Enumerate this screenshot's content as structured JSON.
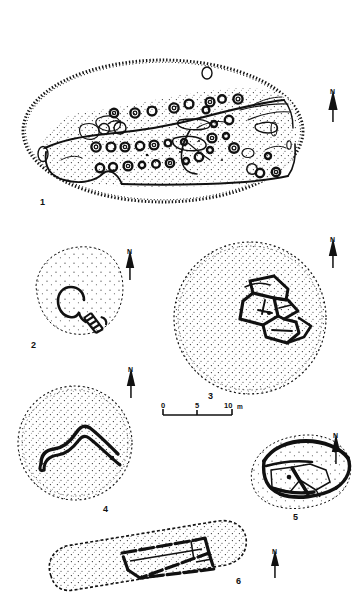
{
  "figure": {
    "kind": "archaeological-site-plans",
    "background_color": "#ffffff",
    "ink_color": "#111111",
    "width": 356,
    "height": 608
  },
  "panels": [
    {
      "id": "panel-1",
      "label": "1",
      "label_x": 40,
      "label_y": 198,
      "description": "Large oval enclosure with hachured outer bank, stippled interior and many small ring features",
      "north": {
        "label": "N",
        "x": 330,
        "y": 88
      }
    },
    {
      "id": "panel-2",
      "label": "2",
      "label_x": 31,
      "label_y": 341,
      "description": "Small circular stippled mound with keyhole-shaped structure and walled passage",
      "north": {
        "label": "N",
        "x": 127,
        "y": 248
      }
    },
    {
      "id": "panel-3",
      "label": "3",
      "label_x": 208,
      "label_y": 392,
      "description": "Large circular stippled mound with central rectilinear building complex",
      "north": {
        "label": "N",
        "x": 330,
        "y": 236
      }
    },
    {
      "id": "panel-4",
      "label": "4",
      "label_x": 103,
      "label_y": 505,
      "description": "Circular stippled mound with V-shaped (chevron) double wall",
      "north": {
        "label": "N",
        "x": 128,
        "y": 366
      }
    },
    {
      "id": "panel-5",
      "label": "5",
      "label_x": 293,
      "label_y": 513,
      "description": "Elongated oval enclosure with heavy perimeter wall and internal compartments",
      "north": {
        "label": "N",
        "x": 333,
        "y": 432
      }
    },
    {
      "id": "panel-6",
      "label": "6",
      "label_x": 236,
      "label_y": 577,
      "description": "Elongated rectangular stippled platform with long rectangular building",
      "north": {
        "label": "N",
        "x": 272,
        "y": 548
      }
    }
  ],
  "scale_bar": {
    "id": "scale-bar",
    "ticks": [
      "0",
      "5",
      "10"
    ],
    "unit": "m",
    "tick_labels": [
      {
        "text": "0",
        "x": 161,
        "y": 404
      },
      {
        "text": "5",
        "x": 190,
        "y": 404
      },
      {
        "text": "10",
        "x": 221,
        "y": 404
      },
      {
        "text": "m",
        "x": 235,
        "y": 406
      }
    ],
    "bar_x1": 163,
    "bar_x2": 232,
    "bar_y": 415
  }
}
